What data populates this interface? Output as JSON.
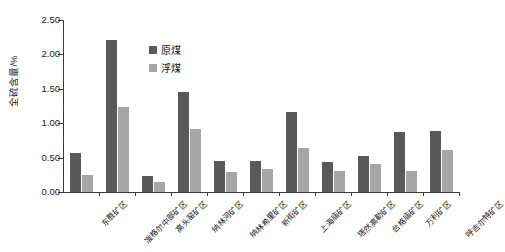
{
  "chart_data": {
    "type": "bar",
    "title": "",
    "xlabel": "",
    "ylabel": "全硫含量/%",
    "ylim": [
      0,
      2.5
    ],
    "ytick_step": 0.5,
    "ytick_labels": [
      "0.00",
      "0.50",
      "1.00",
      "1.50",
      "2.00",
      "2.50"
    ],
    "ytick_values": [
      0,
      0.5,
      1.0,
      1.5,
      2.0,
      2.5
    ],
    "grid": false,
    "legend_position": "top-left-inside",
    "categories": [
      "东胜矿区",
      "准格尔中部矿区",
      "高头窑矿区",
      "纳林河矿区",
      "纳林希里矿区",
      "新街矿区",
      "上海庙矿区",
      "塔然高勒矿区",
      "台格庙矿区",
      "万利矿区",
      "呼吉尔特矿区"
    ],
    "series": [
      {
        "name": "原煤",
        "color": "#595959",
        "values": [
          0.56,
          2.21,
          0.23,
          1.46,
          0.45,
          0.45,
          1.17,
          0.44,
          0.53,
          0.87,
          0.89
        ]
      },
      {
        "name": "浮煤",
        "color": "#a6a6a6",
        "values": [
          0.25,
          1.23,
          0.14,
          0.91,
          0.29,
          0.33,
          0.64,
          0.31,
          0.4,
          0.3,
          0.61
        ]
      }
    ]
  },
  "legend": {
    "items": [
      {
        "label": "原煤",
        "color": "#595959"
      },
      {
        "label": "浮煤",
        "color": "#a6a6a6"
      }
    ]
  }
}
